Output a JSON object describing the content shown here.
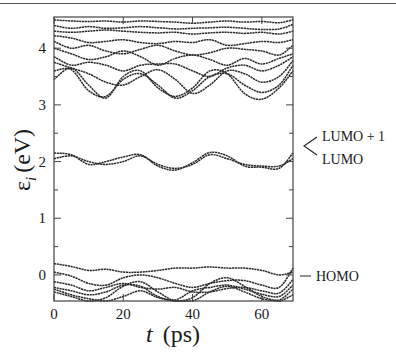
{
  "chart_data": {
    "type": "line",
    "title": "",
    "xlabel": "t (ps)",
    "ylabel": "ε_i (eV)",
    "xlim": [
      0,
      69
    ],
    "ylim": [
      -0.46,
      4.55
    ],
    "xticks": [
      0,
      20,
      40,
      60
    ],
    "yticks": [
      0,
      1,
      2,
      3,
      4
    ],
    "minor_yticks": [
      0.5,
      1.5,
      2.5,
      3.5
    ],
    "grid": false,
    "legend": null,
    "annotations": [
      {
        "text": "LUMO + 1",
        "y": 2.2
      },
      {
        "text": "LUMO",
        "y": 1.85
      },
      {
        "text": "HOMO",
        "y": -0.05
      }
    ],
    "x": [
      0,
      5,
      10,
      15,
      20,
      25,
      30,
      35,
      40,
      45,
      50,
      55,
      60,
      65,
      69
    ],
    "series": [
      {
        "name": "HOMO-5",
        "values": [
          -0.25,
          -0.35,
          -0.42,
          -0.46,
          -0.38,
          -0.28,
          -0.4,
          -0.46,
          -0.46,
          -0.3,
          -0.2,
          -0.3,
          -0.42,
          -0.46,
          -0.35
        ]
      },
      {
        "name": "HOMO-4",
        "values": [
          -0.3,
          -0.38,
          -0.46,
          -0.4,
          -0.2,
          -0.12,
          -0.3,
          -0.46,
          -0.4,
          -0.15,
          -0.05,
          -0.2,
          -0.38,
          -0.44,
          -0.25
        ]
      },
      {
        "name": "HOMO-3",
        "values": [
          -0.22,
          -0.28,
          -0.35,
          -0.3,
          -0.18,
          -0.2,
          -0.38,
          -0.44,
          -0.28,
          -0.22,
          -0.18,
          -0.25,
          -0.34,
          -0.38,
          -0.18
        ]
      },
      {
        "name": "HOMO-2",
        "values": [
          -0.12,
          -0.18,
          -0.28,
          -0.22,
          -0.15,
          -0.22,
          -0.25,
          -0.22,
          -0.3,
          -0.3,
          -0.24,
          -0.22,
          -0.28,
          -0.32,
          -0.08
        ]
      },
      {
        "name": "HOMO-1",
        "values": [
          0.05,
          -0.02,
          -0.15,
          -0.18,
          -0.05,
          0.0,
          -0.05,
          -0.15,
          -0.22,
          -0.15,
          -0.1,
          -0.1,
          -0.18,
          -0.22,
          0.12
        ]
      },
      {
        "name": "HOMO",
        "values": [
          0.2,
          0.15,
          0.08,
          0.1,
          0.05,
          0.05,
          0.08,
          0.12,
          0.12,
          0.14,
          0.12,
          0.12,
          0.08,
          0.0,
          0.05
        ]
      },
      {
        "name": "LUMO",
        "values": [
          2.05,
          2.1,
          2.0,
          1.95,
          2.0,
          2.1,
          1.95,
          1.88,
          1.95,
          2.12,
          2.05,
          1.95,
          1.92,
          1.92,
          2.05
        ]
      },
      {
        "name": "LUMO+1",
        "values": [
          2.15,
          2.12,
          1.95,
          2.0,
          2.08,
          2.12,
          1.92,
          1.85,
          1.98,
          2.16,
          2.1,
          1.92,
          1.9,
          1.88,
          2.15
        ]
      },
      {
        "name": "L+2",
        "values": [
          3.45,
          3.65,
          3.35,
          3.12,
          3.5,
          3.6,
          3.3,
          3.15,
          3.3,
          3.6,
          3.55,
          3.2,
          3.1,
          3.3,
          3.6
        ]
      },
      {
        "name": "L+3",
        "values": [
          3.6,
          3.62,
          3.25,
          3.15,
          3.45,
          3.55,
          3.35,
          3.12,
          3.25,
          3.5,
          3.55,
          3.35,
          3.22,
          3.35,
          3.7
        ]
      },
      {
        "name": "L+4",
        "values": [
          3.75,
          3.65,
          3.55,
          3.4,
          3.35,
          3.5,
          3.62,
          3.45,
          3.2,
          3.35,
          3.6,
          3.55,
          3.4,
          3.5,
          3.78
        ]
      },
      {
        "name": "L+5",
        "values": [
          3.85,
          3.7,
          3.75,
          3.7,
          3.6,
          3.7,
          3.72,
          3.72,
          3.6,
          3.5,
          3.65,
          3.7,
          3.6,
          3.7,
          3.85
        ]
      },
      {
        "name": "L+6",
        "values": [
          4.0,
          3.9,
          3.8,
          3.85,
          3.95,
          3.85,
          3.7,
          3.82,
          3.88,
          3.8,
          3.7,
          3.82,
          3.72,
          3.82,
          3.9
        ]
      },
      {
        "name": "L+7",
        "values": [
          4.12,
          4.0,
          4.05,
          3.95,
          3.9,
          3.98,
          4.05,
          3.95,
          3.88,
          3.92,
          4.0,
          3.98,
          3.95,
          3.88,
          4.05
        ]
      },
      {
        "name": "L+8",
        "values": [
          4.22,
          4.18,
          4.1,
          4.12,
          4.15,
          4.1,
          4.08,
          4.12,
          4.1,
          4.15,
          4.05,
          4.08,
          4.12,
          4.1,
          4.15
        ]
      },
      {
        "name": "L+9",
        "values": [
          4.3,
          4.28,
          4.3,
          4.32,
          4.3,
          4.28,
          4.27,
          4.28,
          4.25,
          4.27,
          4.28,
          4.26,
          4.28,
          4.25,
          4.3
        ]
      },
      {
        "name": "L+10",
        "values": [
          4.4,
          4.35,
          4.38,
          4.35,
          4.36,
          4.38,
          4.36,
          4.34,
          4.35,
          4.36,
          4.37,
          4.35,
          4.33,
          4.34,
          4.42
        ]
      },
      {
        "name": "L+11",
        "values": [
          4.5,
          4.48,
          4.47,
          4.48,
          4.46,
          4.48,
          4.47,
          4.46,
          4.44,
          4.46,
          4.48,
          4.46,
          4.47,
          4.45,
          4.5
        ]
      }
    ]
  },
  "axes": {
    "x_tick_labels": [
      "0",
      "20",
      "40",
      "60"
    ],
    "y_tick_labels": [
      "0",
      "1",
      "2",
      "3",
      "4"
    ],
    "xlabel_italic": "t",
    "xlabel_unit": "(ps)",
    "ylabel_symbol": "ε",
    "ylabel_sub": "i",
    "ylabel_unit": "(eV)"
  },
  "annotations": {
    "lumo_plus_1": "LUMO + 1",
    "lumo": "LUMO",
    "homo": "HOMO"
  },
  "colors": {
    "line": "#2a2a2a",
    "axis": "#444444",
    "background": "#ffffff"
  }
}
